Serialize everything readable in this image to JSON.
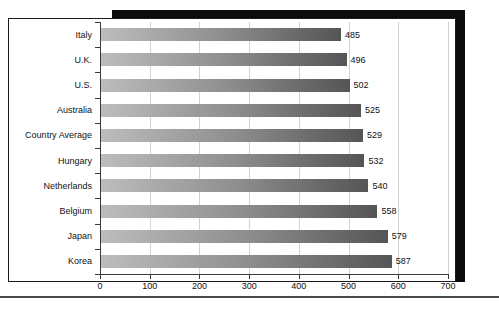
{
  "chart_data": {
    "type": "bar",
    "orientation": "horizontal",
    "title": "",
    "xlabel": "",
    "ylabel": "",
    "categories": [
      "Italy",
      "U.K.",
      "U.S.",
      "Australia",
      "Country Average",
      "Hungary",
      "Netherlands",
      "Belgium",
      "Japan",
      "Korea"
    ],
    "values": [
      485,
      496,
      502,
      525,
      529,
      532,
      540,
      558,
      579,
      587
    ],
    "value_labels": [
      "485",
      "496",
      "502",
      "525",
      "529",
      "532",
      "540",
      "558",
      "579",
      "587"
    ],
    "xlim": [
      0,
      700
    ],
    "xticks": [
      0,
      100,
      200,
      300,
      400,
      500,
      600,
      700
    ],
    "xtick_labels": [
      "0",
      "100",
      "200",
      "300",
      "400",
      "500",
      "600",
      "700"
    ],
    "grid": true,
    "grid_axis": "x",
    "legend": false,
    "data_labels": true,
    "bar_gradient_start": "#bdbdbd",
    "bar_gradient_end": "#555555",
    "gridline_color": "#d2d2d2",
    "axis_color": "#3a3a3a",
    "shadow_color": "#0c0c0c",
    "background": "#ffffff"
  }
}
